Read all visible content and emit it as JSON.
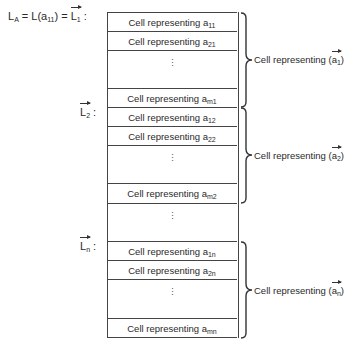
{
  "row_labels": {
    "la": "L",
    "la_sub": "A",
    "eq1": " = L(a",
    "eq1_sub": "11",
    "eq1_end": ") = ",
    "l1": "L",
    "l1_sub": "1",
    "colon": ":",
    "l2": "L",
    "l2_sub": "2",
    "ln": "L",
    "ln_sub": "n"
  },
  "cell_prefix": "Cell representing a",
  "columns": [
    {
      "cells": [
        {
          "sub": "11"
        },
        {
          "sub": "21"
        },
        {
          "sub": "m1"
        }
      ],
      "brace_label": "Cell representing (",
      "vector": "a",
      "vector_sub": "1",
      "brace_close": ")"
    },
    {
      "cells": [
        {
          "sub": "12"
        },
        {
          "sub": "22"
        },
        {
          "sub": "m2"
        }
      ],
      "brace_label": "Cell representing (",
      "vector": "a",
      "vector_sub": "2",
      "brace_close": ")"
    },
    {
      "cells": [
        {
          "sub": "1n"
        },
        {
          "sub": "2n"
        },
        {
          "sub": "mn"
        }
      ],
      "brace_label": "Cell representing (",
      "vector": "a",
      "vector_sub": "n",
      "brace_close": ")"
    }
  ],
  "ellipsis": "⋮"
}
